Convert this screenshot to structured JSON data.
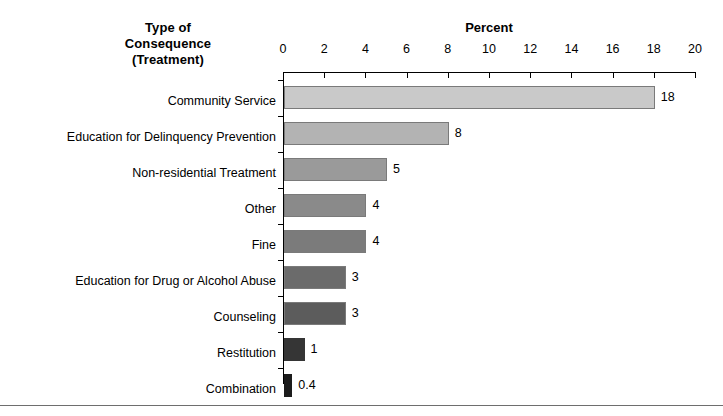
{
  "header": {
    "category_title_lines": [
      "Type of",
      "Consequence",
      "(Treatment)"
    ],
    "value_axis_title": "Percent"
  },
  "chart_data": {
    "type": "bar",
    "orientation": "horizontal",
    "title": "Percent",
    "xlabel": "Percent",
    "ylabel": "Type of Consequence (Treatment)",
    "xlim": [
      0,
      20
    ],
    "xticks": [
      0,
      2,
      4,
      6,
      8,
      10,
      12,
      14,
      16,
      18,
      20
    ],
    "xtick_labels": [
      "0",
      "2",
      "4",
      "6",
      "8",
      "10",
      "12",
      "14",
      "16",
      "18",
      "20"
    ],
    "grid": false,
    "legend": false,
    "categories": [
      "Community Service",
      "Education for Delinquency Prevention",
      "Non-residential Treatment",
      "Other",
      "Fine",
      "Education for Drug or Alcohol Abuse",
      "Counseling",
      "Restitution",
      "Combination"
    ],
    "values": [
      18,
      8,
      5,
      4,
      4,
      3,
      3,
      1,
      0.4
    ],
    "value_labels": [
      "18",
      "8",
      "5",
      "4",
      "4",
      "3",
      "3",
      "1",
      "0.4"
    ],
    "bar_colors": [
      "#c9c9c9",
      "#b3b3b3",
      "#9a9a9a",
      "#8a8a8a",
      "#7b7b7b",
      "#6b6b6b",
      "#5c5c5c",
      "#353535",
      "#1c1c1c"
    ]
  },
  "colors": {
    "axis": "#000000",
    "text": "#000000",
    "background": "#ffffff",
    "rule": "#6e6e6e",
    "bar_outline": "#7a7a7a"
  }
}
